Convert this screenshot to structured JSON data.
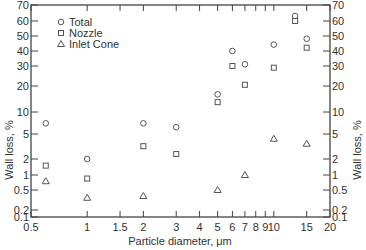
{
  "chart_data": {
    "type": "scatter",
    "title": "",
    "xlabel": "Particle diameter, μm",
    "ylabel": "Wall loss, %",
    "ylabel_right": "Wall loss, %",
    "xscale": "log",
    "yscale": "probability",
    "xlim": [
      0.5,
      20
    ],
    "ylim": [
      0.1,
      70
    ],
    "x_ticks": [
      0.5,
      1,
      1.5,
      2,
      3,
      4,
      5,
      6,
      7,
      8,
      9,
      10,
      15,
      20
    ],
    "x_tick_labels": [
      "0.5",
      "1",
      "1.5",
      "2",
      "3",
      "4",
      "5",
      "6",
      "7",
      "8",
      "9",
      "10",
      "15",
      "20"
    ],
    "y_ticks": [
      0.1,
      0.2,
      0.5,
      1,
      2,
      5,
      10,
      20,
      30,
      40,
      50,
      60,
      70
    ],
    "y_tick_labels": [
      "0.1",
      "0.2",
      "0.5",
      "1",
      "2",
      "5",
      "10",
      "20",
      "30",
      "40",
      "50",
      "60",
      "70"
    ],
    "grid": false,
    "legend_position": "upper left",
    "series": [
      {
        "name": "Total",
        "marker": "circle",
        "x": [
          0.6,
          1,
          2,
          3,
          5,
          6,
          7,
          10,
          13,
          15
        ],
        "y": [
          7,
          2,
          7,
          6.2,
          16,
          40,
          31,
          44,
          63,
          48
        ]
      },
      {
        "name": "Nozzle",
        "marker": "square",
        "x": [
          0.6,
          1,
          2,
          3,
          5,
          6,
          7,
          10,
          13,
          15
        ],
        "y": [
          1.5,
          0.85,
          3.2,
          2.4,
          13,
          30,
          20.5,
          29,
          60,
          42
        ]
      },
      {
        "name": "Inlet Cone",
        "marker": "triangle",
        "x": [
          0.6,
          1,
          2,
          5,
          7,
          10,
          15
        ],
        "y": [
          0.75,
          0.35,
          0.38,
          0.5,
          1,
          4.2,
          3.5
        ]
      }
    ]
  },
  "legend": {
    "items": [
      {
        "label": "Total",
        "marker": "circle"
      },
      {
        "label": "Nozzle",
        "marker": "square"
      },
      {
        "label": "Inlet Cone",
        "marker": "triangle"
      }
    ]
  },
  "colors": {
    "axis": "#444444",
    "marker": "#555555",
    "text": "#333333"
  }
}
